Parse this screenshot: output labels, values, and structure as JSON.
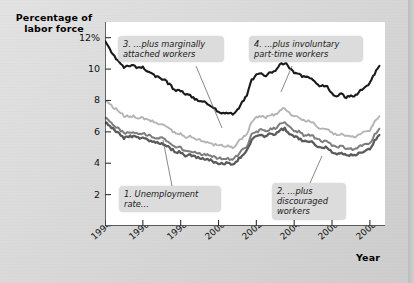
{
  "figure": {
    "y_axis_title": "Percentage of\nlabor force",
    "x_axis_title": "Year"
  },
  "callouts": {
    "c1": {
      "l1": "1. Unemployment",
      "l2": "rate..."
    },
    "c2": {
      "l1": "2. ...plus",
      "l2": "discouraged",
      "l3": "workers"
    },
    "c3": {
      "l1": "3. ...plus marginally",
      "l2": "attached workers"
    },
    "c4": {
      "l1": "4. ...plus involuntary",
      "l2": "part-time workers"
    }
  },
  "chart_data": {
    "type": "line",
    "title": "",
    "subtitle": "",
    "xlabel": "Year",
    "ylabel": "Percentage of labor force",
    "xlim": [
      1994,
      2008.8
    ],
    "ylim": [
      0,
      13
    ],
    "grid": false,
    "legend_position": "none (inline callout labels)",
    "ytick_values": [
      2,
      4,
      6,
      8,
      10,
      12
    ],
    "ytick_labels": [
      "2",
      "4",
      "6",
      "8",
      "10",
      "12%"
    ],
    "xtick_values": [
      1994,
      1996,
      1998,
      2000,
      2002,
      2004,
      2006,
      2008
    ],
    "xtick_labels": [
      "1994",
      "1996",
      "1998",
      "2000",
      "2002",
      "2004",
      "2006",
      "2008"
    ],
    "x": [
      1994.0,
      1994.25,
      1994.5,
      1994.75,
      1995.0,
      1995.25,
      1995.5,
      1995.75,
      1996.0,
      1996.25,
      1996.5,
      1996.75,
      1997.0,
      1997.25,
      1997.5,
      1997.75,
      1998.0,
      1998.25,
      1998.5,
      1998.75,
      1999.0,
      1999.25,
      1999.5,
      1999.75,
      2000.0,
      2000.25,
      2000.5,
      2000.75,
      2001.0,
      2001.25,
      2001.5,
      2001.75,
      2002.0,
      2002.25,
      2002.5,
      2002.75,
      2003.0,
      2003.25,
      2003.5,
      2003.75,
      2004.0,
      2004.25,
      2004.5,
      2004.75,
      2005.0,
      2005.25,
      2005.5,
      2005.75,
      2006.0,
      2006.25,
      2006.5,
      2006.75,
      2007.0,
      2007.25,
      2007.5,
      2007.75,
      2008.0,
      2008.25,
      2008.5
    ],
    "series": [
      {
        "name": "1. Unemployment rate",
        "color": "#5a5a5a",
        "values": [
          6.6,
          6.4,
          6.1,
          5.9,
          5.6,
          5.7,
          5.7,
          5.6,
          5.6,
          5.5,
          5.4,
          5.3,
          5.3,
          5.1,
          4.9,
          4.7,
          4.7,
          4.5,
          4.5,
          4.4,
          4.3,
          4.3,
          4.2,
          4.1,
          4.0,
          4.0,
          4.0,
          3.9,
          4.2,
          4.5,
          4.8,
          5.5,
          5.7,
          5.8,
          5.7,
          5.9,
          5.8,
          6.1,
          6.2,
          5.9,
          5.7,
          5.6,
          5.4,
          5.4,
          5.3,
          5.1,
          5.0,
          5.0,
          4.7,
          4.6,
          4.7,
          4.5,
          4.5,
          4.5,
          4.7,
          4.8,
          4.9,
          5.4,
          5.8
        ]
      },
      {
        "name": "2. ...plus discouraged workers",
        "color": "#7d7d7d",
        "values": [
          6.9,
          6.7,
          6.4,
          6.2,
          5.9,
          6.0,
          6.0,
          5.9,
          5.9,
          5.8,
          5.7,
          5.6,
          5.6,
          5.4,
          5.2,
          5.0,
          5.0,
          4.8,
          4.8,
          4.7,
          4.6,
          4.6,
          4.5,
          4.4,
          4.3,
          4.3,
          4.3,
          4.2,
          4.5,
          4.8,
          5.1,
          5.8,
          6.0,
          6.1,
          6.0,
          6.2,
          6.2,
          6.5,
          6.6,
          6.3,
          6.1,
          6.0,
          5.8,
          5.8,
          5.7,
          5.5,
          5.4,
          5.4,
          5.1,
          5.0,
          5.1,
          4.9,
          4.9,
          4.9,
          5.1,
          5.2,
          5.3,
          5.8,
          6.2
        ]
      },
      {
        "name": "3. ...plus marginally attached workers",
        "color": "#b4b4b4",
        "values": [
          8.0,
          7.8,
          7.5,
          7.3,
          7.0,
          7.0,
          7.0,
          6.9,
          6.9,
          6.8,
          6.7,
          6.5,
          6.5,
          6.3,
          6.1,
          5.9,
          5.9,
          5.7,
          5.7,
          5.6,
          5.5,
          5.4,
          5.3,
          5.2,
          5.1,
          5.1,
          5.1,
          5.0,
          5.3,
          5.6,
          5.9,
          6.6,
          6.9,
          7.0,
          6.9,
          7.1,
          7.1,
          7.4,
          7.5,
          7.2,
          7.0,
          6.9,
          6.7,
          6.7,
          6.6,
          6.3,
          6.2,
          6.2,
          5.9,
          5.8,
          5.9,
          5.7,
          5.7,
          5.7,
          5.9,
          6.0,
          6.1,
          6.6,
          7.0
        ]
      },
      {
        "name": "4. ...plus involuntary part-time workers",
        "color": "#1a1a1a",
        "values": [
          11.8,
          11.3,
          10.8,
          10.4,
          10.1,
          10.2,
          10.2,
          10.1,
          10.1,
          9.9,
          9.7,
          9.5,
          9.4,
          9.2,
          8.9,
          8.6,
          8.6,
          8.4,
          8.3,
          8.1,
          8.0,
          7.9,
          7.7,
          7.5,
          7.3,
          7.2,
          7.2,
          7.1,
          7.4,
          7.9,
          8.3,
          9.3,
          9.6,
          9.7,
          9.6,
          9.8,
          9.9,
          10.3,
          10.4,
          10.1,
          9.8,
          9.7,
          9.5,
          9.5,
          9.3,
          9.0,
          8.9,
          8.9,
          8.4,
          8.3,
          8.4,
          8.2,
          8.3,
          8.3,
          8.6,
          8.8,
          9.1,
          9.7,
          10.2
        ]
      }
    ]
  }
}
